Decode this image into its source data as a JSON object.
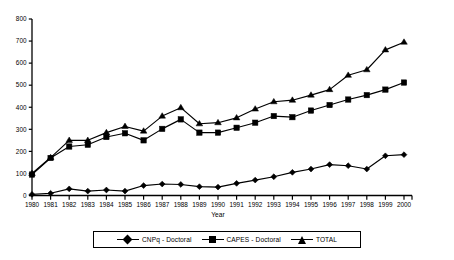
{
  "chart_data": {
    "type": "line",
    "title": "",
    "xlabel": "Year",
    "ylabel": "",
    "x": [
      1980,
      1981,
      1982,
      1983,
      1984,
      1985,
      1986,
      1987,
      1988,
      1989,
      1990,
      1991,
      1992,
      1993,
      1994,
      1995,
      1996,
      1997,
      1998,
      1999,
      2000
    ],
    "categories": [
      "1980",
      "1981",
      "1982",
      "1983",
      "1984",
      "1985",
      "1986",
      "1987",
      "1988",
      "1989",
      "1990",
      "1991",
      "1992",
      "1993",
      "1994",
      "1995",
      "1996",
      "1997",
      "1998",
      "1999",
      "2000"
    ],
    "series": [
      {
        "name": "CNPq - Doctoral",
        "marker": "diamond",
        "values": [
          5,
          10,
          30,
          20,
          25,
          20,
          45,
          52,
          50,
          40,
          38,
          55,
          70,
          85,
          105,
          120,
          140,
          135,
          120,
          180,
          185
        ]
      },
      {
        "name": "CAPES - Doctoral",
        "marker": "square",
        "values": [
          95,
          170,
          222,
          230,
          265,
          282,
          250,
          302,
          345,
          285,
          285,
          307,
          330,
          360,
          355,
          385,
          410,
          435,
          455,
          480,
          512
        ]
      },
      {
        "name": "TOTAL",
        "marker": "triangle",
        "values": [
          100,
          172,
          250,
          250,
          285,
          313,
          292,
          360,
          398,
          325,
          330,
          352,
          392,
          425,
          432,
          455,
          480,
          545,
          570,
          660,
          695
        ]
      }
    ],
    "ylim": [
      0,
      800
    ],
    "yticks": [
      0,
      100,
      200,
      300,
      400,
      500,
      600,
      700,
      800
    ],
    "ytick_labels": [
      "0",
      "100",
      "200",
      "300",
      "400",
      "500",
      "600",
      "700",
      "800"
    ],
    "grid": false,
    "legend_position": "bottom",
    "line_color": "#000000",
    "background_color": "#ffffff"
  },
  "legend": {
    "entries": [
      {
        "label": "CNPq - Doctoral",
        "marker": "diamond"
      },
      {
        "label": "CAPES - Doctoral",
        "marker": "square"
      },
      {
        "label": "TOTAL",
        "marker": "triangle"
      }
    ]
  }
}
